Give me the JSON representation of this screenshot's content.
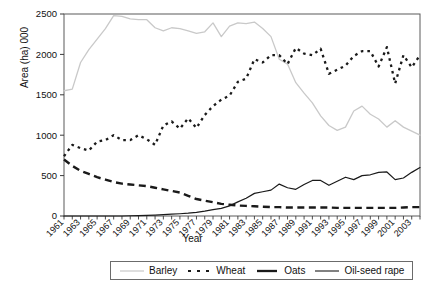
{
  "chart_data": {
    "type": "line",
    "title": "",
    "xlabel": "Year",
    "ylabel": "Area (ha) 000",
    "xlim": [
      1961,
      2004
    ],
    "ylim": [
      0,
      2500
    ],
    "yticks": [
      0,
      500,
      1000,
      1500,
      2000,
      2500
    ],
    "grid": false,
    "legend_position": "bottom-center",
    "x": [
      1961,
      1962,
      1963,
      1964,
      1965,
      1966,
      1967,
      1968,
      1969,
      1970,
      1971,
      1972,
      1973,
      1974,
      1975,
      1976,
      1977,
      1978,
      1979,
      1980,
      1981,
      1982,
      1983,
      1984,
      1985,
      1986,
      1987,
      1988,
      1989,
      1990,
      1991,
      1992,
      1993,
      1994,
      1995,
      1996,
      1997,
      1998,
      1999,
      2000,
      2001,
      2002,
      2003,
      2004
    ],
    "xtick_labels": [
      "1961",
      "1963",
      "1965",
      "1967",
      "1969",
      "1971",
      "1973",
      "1975",
      "1977",
      "1979",
      "1981",
      "1983",
      "1985",
      "1987",
      "1989",
      "1991",
      "1993",
      "1995",
      "1997",
      "1999",
      "2001",
      "2003"
    ],
    "series": [
      {
        "name": "Barley",
        "color": "#c9c9c9",
        "style": "solid-thin-gray",
        "values": [
          1550,
          1570,
          1900,
          2060,
          2190,
          2320,
          2480,
          2470,
          2440,
          2430,
          2430,
          2330,
          2290,
          2330,
          2320,
          2290,
          2260,
          2280,
          2390,
          2220,
          2350,
          2390,
          2380,
          2400,
          2320,
          2220,
          1940,
          1880,
          1650,
          1520,
          1400,
          1240,
          1120,
          1060,
          1100,
          1300,
          1360,
          1260,
          1200,
          1100,
          1180,
          1100,
          1050,
          1000
        ]
      },
      {
        "name": "Wheat",
        "color": "#1a1a1a",
        "style": "dotted-black",
        "values": [
          740,
          880,
          840,
          810,
          920,
          940,
          1000,
          940,
          940,
          1000,
          950,
          880,
          1120,
          1170,
          1080,
          1210,
          1090,
          1250,
          1360,
          1440,
          1490,
          1660,
          1700,
          1940,
          1900,
          1990,
          1990,
          1880,
          2080,
          2010,
          1990,
          2070,
          1760,
          1810,
          1860,
          1980,
          2040,
          2040,
          1850,
          2090,
          1640,
          1990,
          1840,
          1990
        ]
      },
      {
        "name": "Oats",
        "color": "#1a1a1a",
        "style": "dashed-black-thick",
        "values": [
          700,
          620,
          560,
          520,
          480,
          450,
          420,
          400,
          390,
          380,
          370,
          350,
          330,
          310,
          290,
          250,
          210,
          190,
          170,
          150,
          140,
          130,
          125,
          120,
          115,
          110,
          110,
          105,
          105,
          105,
          105,
          105,
          105,
          100,
          100,
          100,
          100,
          100,
          100,
          100,
          100,
          105,
          110,
          110
        ]
      },
      {
        "name": "Oil-seed rape",
        "color": "#1a1a1a",
        "style": "solid-black-thin",
        "values": [
          0,
          0,
          0,
          0,
          0,
          0,
          0,
          0,
          3,
          5,
          8,
          12,
          16,
          22,
          28,
          35,
          45,
          60,
          80,
          95,
          125,
          175,
          220,
          280,
          300,
          320,
          395,
          350,
          330,
          390,
          440,
          440,
          380,
          430,
          480,
          450,
          500,
          510,
          540,
          545,
          450,
          470,
          540,
          600
        ]
      }
    ]
  },
  "legend": {
    "items": [
      {
        "label": "Barley",
        "swatch": "solid-thin-gray"
      },
      {
        "label": "Wheat",
        "swatch": "dotted-black"
      },
      {
        "label": "Oats",
        "swatch": "dashed-black-thick"
      },
      {
        "label": "Oil-seed rape",
        "swatch": "solid-black-thin"
      }
    ]
  }
}
